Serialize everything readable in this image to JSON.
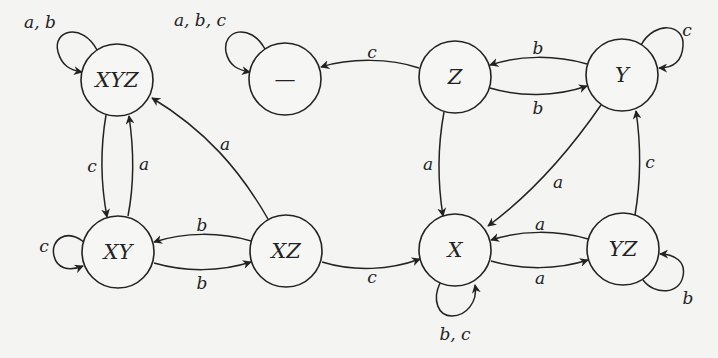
{
  "diagram": {
    "type": "state-machine",
    "nodes": [
      {
        "id": "XYZ",
        "label": "XYZ",
        "x": 117,
        "y": 80
      },
      {
        "id": "dead",
        "label": "—",
        "x": 285,
        "y": 79
      },
      {
        "id": "Z",
        "label": "Z",
        "x": 455,
        "y": 77
      },
      {
        "id": "Y",
        "label": "Y",
        "x": 622,
        "y": 75
      },
      {
        "id": "XY",
        "label": "XY",
        "x": 118,
        "y": 252
      },
      {
        "id": "XZ",
        "label": "XZ",
        "x": 286,
        "y": 251
      },
      {
        "id": "X",
        "label": "X",
        "x": 455,
        "y": 250
      },
      {
        "id": "YZ",
        "label": "YZ",
        "x": 623,
        "y": 249
      }
    ],
    "edges": [
      {
        "from": "XYZ",
        "to": "XYZ",
        "label": "a, b"
      },
      {
        "from": "dead",
        "to": "dead",
        "label": "a, b, c"
      },
      {
        "from": "Z",
        "to": "dead",
        "label": "c"
      },
      {
        "from": "Y",
        "to": "Z",
        "label": "b"
      },
      {
        "from": "Z",
        "to": "Y",
        "label": "b"
      },
      {
        "from": "Y",
        "to": "Y",
        "label": "c"
      },
      {
        "from": "XYZ",
        "to": "XY",
        "label": "c"
      },
      {
        "from": "XY",
        "to": "XYZ",
        "label": "a"
      },
      {
        "from": "XZ",
        "to": "XYZ",
        "label": "a"
      },
      {
        "from": "Z",
        "to": "X",
        "label": "a"
      },
      {
        "from": "Y",
        "to": "X",
        "label": "a"
      },
      {
        "from": "YZ",
        "to": "Y",
        "label": "c"
      },
      {
        "from": "XY",
        "to": "XY",
        "label": "c"
      },
      {
        "from": "XZ",
        "to": "XY",
        "label": "b"
      },
      {
        "from": "XY",
        "to": "XZ",
        "label": "b"
      },
      {
        "from": "XZ",
        "to": "X",
        "label": "c"
      },
      {
        "from": "YZ",
        "to": "X",
        "label": "a"
      },
      {
        "from": "X",
        "to": "YZ",
        "label": "a"
      },
      {
        "from": "X",
        "to": "X",
        "label": "b, c"
      },
      {
        "from": "YZ",
        "to": "YZ",
        "label": "b"
      }
    ]
  }
}
